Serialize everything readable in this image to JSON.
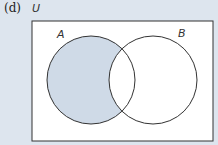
{
  "diagram": {
    "part_label": "(d)",
    "universe_label": "U",
    "sets": [
      {
        "label": "A",
        "cx": 91,
        "cy": 80,
        "r": 44
      },
      {
        "label": "B",
        "cx": 153,
        "cy": 80,
        "r": 44
      }
    ],
    "shaded_region": "A \\ B",
    "colors": {
      "background": "#dde5ee",
      "box_fill": "#ffffff",
      "shade": "#cfdae7",
      "stroke": "#333333"
    }
  }
}
